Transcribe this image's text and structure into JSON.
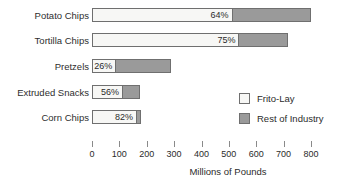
{
  "chart_data": {
    "type": "bar",
    "orientation": "horizontal",
    "stacked": true,
    "title": "",
    "xlabel": "Millions of Pounds",
    "ylabel": "",
    "xlim": [
      0,
      800
    ],
    "xticks": [
      0,
      100,
      200,
      300,
      400,
      500,
      600,
      700,
      800
    ],
    "xtick_labels": [
      "0",
      "100",
      "200",
      "300",
      "400",
      "500",
      "600",
      "700",
      "800"
    ],
    "grid": false,
    "legend_position": "center-right",
    "categories": [
      "Potato Chips",
      "Tortilla Chips",
      "Pretzels",
      "Extruded Snacks",
      "Corn Chips"
    ],
    "series": [
      {
        "name": "Frito-Lay",
        "color": "#f7f7f5",
        "values": [
          510,
          535,
          85,
          110,
          161
        ],
        "labels": [
          "64%",
          "75%",
          "26%",
          "56%",
          "82%"
        ]
      },
      {
        "name": "Rest of Industry",
        "color": "#9a9a9a",
        "values": [
          290,
          180,
          205,
          66,
          19
        ],
        "labels": [
          "",
          "",
          "",
          "",
          ""
        ]
      }
    ],
    "totals": [
      800,
      715,
      290,
      176,
      180
    ],
    "bars": [
      {
        "category": "Potato Chips",
        "light_value": 510,
        "dark_value": 290,
        "total": 800,
        "pct_label": "64%"
      },
      {
        "category": "Tortilla Chips",
        "light_value": 535,
        "dark_value": 180,
        "total": 715,
        "pct_label": "75%"
      },
      {
        "category": "Pretzels",
        "light_value": 85,
        "dark_value": 205,
        "total": 290,
        "pct_label": "26%"
      },
      {
        "category": "Extruded Snacks",
        "light_value": 110,
        "dark_value": 66,
        "total": 176,
        "pct_label": "56%"
      },
      {
        "category": "Corn Chips",
        "light_value": 161,
        "dark_value": 19,
        "total": 180,
        "pct_label": "82%"
      }
    ]
  },
  "legend": {
    "items": [
      {
        "label": "Frito-Lay",
        "color": "#f7f7f5"
      },
      {
        "label": "Rest of Industry",
        "color": "#9a9a9a"
      }
    ]
  },
  "colors": {
    "frito_lay": "#f7f7f5",
    "rest_of_industry": "#9a9a9a",
    "bar_outline": "#6f6f6f",
    "text": "#2b2b2b",
    "background": "#ffffff"
  }
}
